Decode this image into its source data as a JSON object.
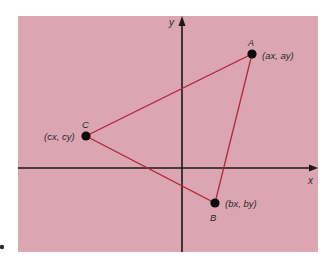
{
  "figure": {
    "background_color": "#ffffff",
    "panel_color": "#dba6b2",
    "triangle_color": "#b3283d",
    "axis_color": "#1e1618",
    "point_color": "#0d0d0d"
  },
  "axes": {
    "x_label": "x",
    "y_label": "y"
  },
  "points": [
    {
      "name": "A",
      "coord_label": "(ax, ay)"
    },
    {
      "name": "B",
      "coord_label": "(bx, by)"
    },
    {
      "name": "C",
      "coord_label": "(cx, cy)"
    }
  ]
}
